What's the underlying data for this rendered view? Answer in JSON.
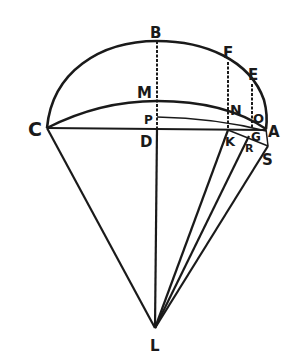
{
  "diagram": {
    "type": "geometric-construction",
    "colors": {
      "ink": "#1a1a1a",
      "background": "#ffffff"
    },
    "labels": {
      "B": "B",
      "F": "F",
      "E": "E",
      "M": "M",
      "N": "N",
      "O": "O",
      "C": "C",
      "P": "P",
      "A": "A",
      "D": "D",
      "K": "K",
      "G": "G",
      "R": "R",
      "S": "S",
      "L": "L"
    },
    "points": {
      "C": [
        47,
        128
      ],
      "B": [
        157,
        41
      ],
      "F": [
        228,
        60
      ],
      "E": [
        252,
        82
      ],
      "A": [
        266,
        129
      ],
      "M": [
        157,
        101
      ],
      "P": [
        157,
        117
      ],
      "D": [
        157,
        129
      ],
      "N": [
        229,
        110
      ],
      "O": [
        253,
        118
      ],
      "K": [
        228,
        130
      ],
      "G": [
        252,
        131
      ],
      "R": [
        249,
        136
      ],
      "S": [
        268,
        147
      ],
      "L": [
        155,
        328
      ]
    }
  }
}
